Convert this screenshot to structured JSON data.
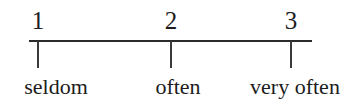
{
  "chart_data": {
    "type": "table",
    "title": "",
    "subtitle": "",
    "xlabel": "",
    "ylabel": "",
    "orientation": "horizontal",
    "axis_range": [
      1,
      3
    ],
    "grid": false,
    "legend": false,
    "categories": [
      "1",
      "2",
      "3"
    ],
    "values": [
      1,
      2,
      3
    ],
    "tick_labels": [
      "seldom",
      "often",
      "very often"
    ],
    "points": [
      {
        "number": "1",
        "label": "seldom"
      },
      {
        "number": "2",
        "label": "often"
      },
      {
        "number": "3",
        "label": "very often"
      }
    ],
    "colors": {
      "background": "#ffffff",
      "line": "#2b2b2b",
      "tick": "#3a3a3a",
      "text": "#1c1c1c"
    }
  }
}
